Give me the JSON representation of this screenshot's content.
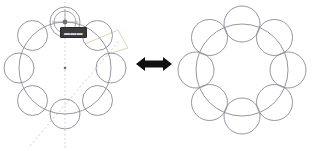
{
  "canvas": {
    "width": 320,
    "height": 151,
    "background": "#ffffff"
  },
  "caption": {
    "clipped_text": "· ·· · ··· · ··"
  },
  "colors": {
    "circle_stroke": "#8a8a96",
    "ring_stroke": "#8a8a96",
    "guide_vertical": "#b9b9c4",
    "guide_diagonal": "#c2bfb6",
    "guide_angle": "#d8cfa8",
    "handle_stroke": "#9a9aa6",
    "handle_fill": "#6f6f78",
    "center_marker": "#6b6b74",
    "arrow_fill": "#111111",
    "tooltip_bg": "#3b3b3b",
    "tooltip_text": "#d8d8d8"
  },
  "tooltip": {
    "label": "▬▬▬"
  },
  "arrow": {
    "name": "double-headed-arrow",
    "direction": "bidirectional"
  },
  "figures": [
    {
      "id": "left",
      "name": "pattern-edit-state",
      "title": "Circular pattern with construction guides",
      "ring": {
        "cx": 65,
        "cy": 68,
        "r": 46
      },
      "circle_radius": 15,
      "circle_count": 8,
      "start_angle_deg": -90,
      "circles": [
        {
          "index": 1,
          "angle_deg": -90,
          "cx": 65.0,
          "cy": 22.0
        },
        {
          "index": 2,
          "angle_deg": -45,
          "cx": 97.5,
          "cy": 35.5
        },
        {
          "index": 3,
          "angle_deg": 0,
          "cx": 111.0,
          "cy": 68.0
        },
        {
          "index": 4,
          "angle_deg": 45,
          "cx": 97.5,
          "cy": 100.5
        },
        {
          "index": 5,
          "angle_deg": 90,
          "cx": 65.0,
          "cy": 114.0
        },
        {
          "index": 6,
          "angle_deg": 135,
          "cx": 32.5,
          "cy": 100.5
        },
        {
          "index": 7,
          "angle_deg": 180,
          "cx": 19.0,
          "cy": 68.0
        },
        {
          "index": 8,
          "angle_deg": 225,
          "cx": 32.5,
          "cy": 35.5
        }
      ],
      "guides": [
        {
          "name": "vertical-axis-guide",
          "type": "dotted",
          "x1": 65,
          "y1": 2,
          "x2": 65,
          "y2": 149
        },
        {
          "name": "diagonal-axis-guide",
          "type": "dashed",
          "x1": 30,
          "y1": 146,
          "x2": 120,
          "y2": 40
        },
        {
          "name": "angle-leader-guide",
          "type": "solid-light",
          "points": "85,44 118,30 128,48 108,54"
        }
      ],
      "center_marker": {
        "name": "pattern-center-marker",
        "cx": 65,
        "cy": 68
      },
      "handle": {
        "name": "rotation-drag-handle",
        "cx": 65,
        "cy": 22,
        "r": 11,
        "crosshair": true
      }
    },
    {
      "id": "right",
      "name": "pattern-result-state",
      "title": "Resulting circular pattern",
      "ring": {
        "cx": 82,
        "cy": 70,
        "r": 46
      },
      "circle_radius": 18,
      "circle_count": 8,
      "start_angle_deg": -90,
      "circles": [
        {
          "index": 1,
          "angle_deg": -90,
          "cx": 82.0,
          "cy": 24.0
        },
        {
          "index": 2,
          "angle_deg": -45,
          "cx": 114.5,
          "cy": 37.5
        },
        {
          "index": 3,
          "angle_deg": 0,
          "cx": 128.0,
          "cy": 70.0
        },
        {
          "index": 4,
          "angle_deg": 45,
          "cx": 114.5,
          "cy": 102.5
        },
        {
          "index": 5,
          "angle_deg": 90,
          "cx": 82.0,
          "cy": 116.0
        },
        {
          "index": 6,
          "angle_deg": 135,
          "cx": 49.5,
          "cy": 102.5
        },
        {
          "index": 7,
          "angle_deg": 180,
          "cx": 36.0,
          "cy": 70.0
        },
        {
          "index": 8,
          "angle_deg": 225,
          "cx": 49.5,
          "cy": 37.5
        }
      ],
      "guides": [],
      "center_marker": null,
      "handle": null
    }
  ]
}
